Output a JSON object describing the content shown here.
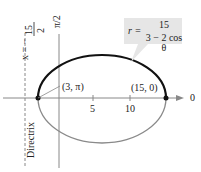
{
  "diagram": {
    "type": "polar-ellipse",
    "equation": {
      "lhs": "r =",
      "numerator": "15",
      "denominator": "3 − 2 cos θ"
    },
    "directrix_equation": {
      "lhs": "x = −",
      "numerator": "15",
      "denominator": "2"
    },
    "directrix_label": "Directrix",
    "vertices": [
      {
        "label": "(3, π)"
      },
      {
        "label": "(15, 0)"
      }
    ],
    "axis_labels": {
      "polar_axis": "0",
      "vertical_axis": "π/2",
      "vertical_num": "π",
      "vertical_den": "2"
    },
    "ticks": [
      "5",
      "10"
    ],
    "colors": {
      "upper_curve": "#111111",
      "lower_curve": "#8a8a8a",
      "axes": "#888888",
      "label_box": "#e6e6e6"
    }
  }
}
